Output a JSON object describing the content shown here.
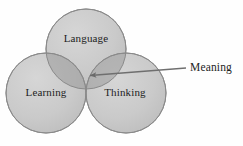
{
  "diagram": {
    "type": "venn-three-circle",
    "background_color": "#fefefe",
    "circle_fill_color": "#c9c9c9",
    "circle_stroke_color": "#8a8a8a",
    "overlap_fill_color": "#a9a9a9",
    "triple_overlap_fill_color": "#9a9a9a",
    "text_color": "#1d1d1d",
    "arrow_color": "#6f6f6f",
    "circles": [
      {
        "id": "language",
        "label": "Language",
        "cx": 86,
        "cy": 49,
        "r": 40
      },
      {
        "id": "learning",
        "label": "Learning",
        "cx": 46,
        "cy": 93,
        "r": 40
      },
      {
        "id": "thinking",
        "label": "Thinking",
        "cx": 126,
        "cy": 93,
        "r": 40
      }
    ],
    "annotation": {
      "label": "Meaning",
      "target": "triple-intersection",
      "arrow_from_x": 186,
      "arrow_from_y": 68,
      "arrow_to_x": 88,
      "arrow_to_y": 76
    }
  }
}
